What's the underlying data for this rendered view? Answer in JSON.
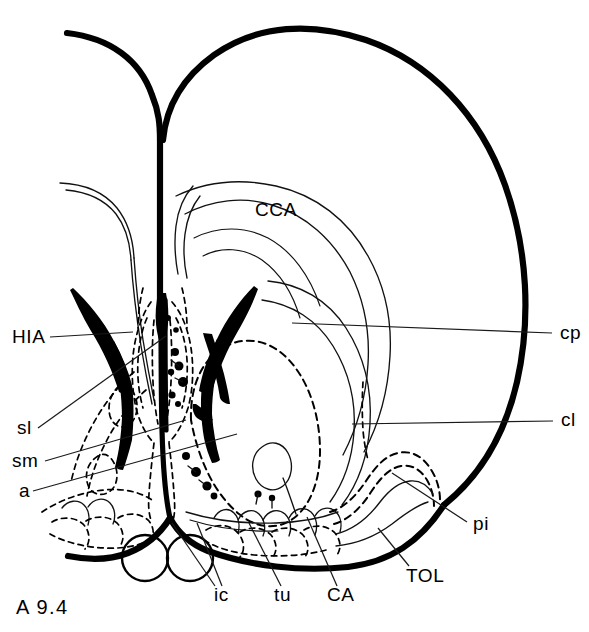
{
  "figure": {
    "plate_label": "A 9.4",
    "kind": "coronal-brain-section-line-drawing",
    "colors": {
      "ink": "#000000",
      "background": "#ffffff",
      "leader": "#1a1a1a"
    }
  },
  "labels": {
    "left": [
      {
        "id": "hia",
        "text": "HIA",
        "x": 12,
        "y": 343
      },
      {
        "id": "sl",
        "text": "sl",
        "x": 17,
        "y": 434
      },
      {
        "id": "sm",
        "text": "sm",
        "x": 12,
        "y": 467
      },
      {
        "id": "a",
        "text": "a",
        "x": 19,
        "y": 497
      }
    ],
    "right": [
      {
        "id": "cp",
        "text": "cp",
        "x": 560,
        "y": 339
      },
      {
        "id": "cl",
        "text": "cl",
        "x": 561,
        "y": 426
      },
      {
        "id": "pi",
        "text": "pi",
        "x": 473,
        "y": 530
      }
    ],
    "bottom": [
      {
        "id": "ic",
        "text": "ic",
        "x": 214,
        "y": 601
      },
      {
        "id": "tu",
        "text": "tu",
        "x": 274,
        "y": 601
      },
      {
        "id": "ca",
        "text": "CA",
        "x": 327,
        "y": 601
      },
      {
        "id": "tol",
        "text": "TOL",
        "x": 406,
        "y": 582
      }
    ],
    "interior": [
      {
        "id": "cca",
        "text": "CCA",
        "x": 255,
        "y": 216
      }
    ]
  },
  "structures": {
    "outer_cortex": "heavy outer contour of left cerebral hemisphere with midline interhemispheric fissure",
    "corpus_callosum": "CCA — corpus callosum, thin double arc over the ventricle",
    "lateral_ventricle": "solid black wedge-shaped lateral ventricle pair flanking the midline",
    "caudate_putamen": "cp — caudate-putamen complex, thin contour in dorsolateral hemisphere",
    "claustrum": "cl — claustrum, short dashed vertical band lateral to the striatum",
    "accumbens": "a — nucleus accumbens, large dashed oval in ventral forebrain",
    "septum_lateral": "sl — lateral septal nucleus, dashed outline adjacent to midline",
    "septum_medial": "sm — medial septal nucleus, narrow dashed midline column",
    "hippocampal_anlage": "HIA — solid black structure at the dorsal tip of the ventricle",
    "anterior_commissure": "CA — anterior commissure crossing the ventral midline",
    "internal_capsule": "ic — internal capsule fibers at ventral forebrain base",
    "olfactory_tubercle": "tu — olfactory tubercle, scalloped dashed islands along ventral surface",
    "piriform_cortex": "pi — piriform cortex, wavy dashed band along ventrolateral edge",
    "lateral_olfactory_tract": "TOL — lateral olfactory tract along the ventral surface",
    "optic_structures": "two open circles at the ventral midline below the brain base"
  }
}
